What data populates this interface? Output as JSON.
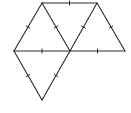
{
  "diagram": {
    "type": "geometry-figure",
    "stroke_color": "#2a2a2a",
    "background": "#ffffff",
    "vertices": {
      "A": [
        42,
        3
      ],
      "B": [
        97,
        3
      ],
      "C": [
        14,
        51
      ],
      "D": [
        70,
        51
      ],
      "E": [
        125,
        51
      ],
      "F": [
        42,
        100
      ]
    },
    "edges": [
      [
        "A",
        "B"
      ],
      [
        "A",
        "C"
      ],
      [
        "A",
        "D"
      ],
      [
        "B",
        "D"
      ],
      [
        "B",
        "E"
      ],
      [
        "C",
        "D"
      ],
      [
        "D",
        "E"
      ],
      [
        "C",
        "F"
      ],
      [
        "D",
        "F"
      ]
    ],
    "triangles": [
      [
        "A",
        "C",
        "D"
      ],
      [
        "A",
        "B",
        "D"
      ],
      [
        "B",
        "D",
        "E"
      ],
      [
        "C",
        "D",
        "F"
      ]
    ],
    "tick_marks": "single tick at midpoint of every edge"
  }
}
